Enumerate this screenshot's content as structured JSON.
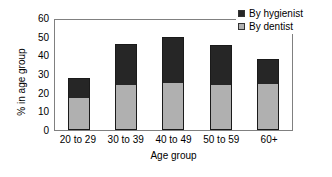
{
  "chart_data": {
    "type": "bar",
    "stacked": true,
    "title": "",
    "subtitle": "",
    "xlabel": "Age group",
    "ylabel": "% in age group",
    "categories": [
      "20 to 29",
      "30 to 39",
      "40 to 49",
      "50 to 59",
      "60+"
    ],
    "series": [
      {
        "name": "By dentist",
        "color": "#b0b0b0",
        "values": [
          17,
          24,
          25,
          24,
          24.5
        ]
      },
      {
        "name": "By hygienist",
        "color": "#262626",
        "values": [
          11,
          22,
          25,
          21.5,
          13.5
        ]
      }
    ],
    "totals": [
      28,
      46,
      50,
      45.5,
      38
    ],
    "ylim": [
      0,
      60
    ],
    "yticks": [
      0,
      10,
      20,
      30,
      40,
      50,
      60
    ],
    "ytick_labels": [
      "0",
      "10",
      "20",
      "30",
      "40",
      "50",
      "60"
    ],
    "grid": false,
    "legend_position": "top-right",
    "legend_entries": [
      "By hygienist",
      "By dentist"
    ]
  },
  "legend": {
    "items": [
      {
        "label": "By hygienist",
        "color": "#262626"
      },
      {
        "label": "By dentist",
        "color": "#b0b0b0"
      }
    ]
  },
  "axes": {
    "y_title": "% in age group",
    "x_title": "Age group"
  }
}
